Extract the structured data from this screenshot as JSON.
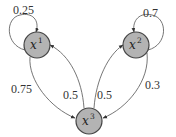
{
  "diagram": {
    "type": "markov-chain",
    "nodes": [
      {
        "id": "x1",
        "base": "x",
        "sup": "1",
        "cx": 37,
        "cy": 45
      },
      {
        "id": "x2",
        "base": "x",
        "sup": "2",
        "cx": 136,
        "cy": 45
      },
      {
        "id": "x3",
        "base": "x",
        "sup": "3",
        "cx": 89,
        "cy": 121
      }
    ],
    "edges": [
      {
        "from": "x1",
        "to": "x1",
        "label": "0.25"
      },
      {
        "from": "x2",
        "to": "x2",
        "label": "0.7"
      },
      {
        "from": "x1",
        "to": "x3",
        "label": "0.75"
      },
      {
        "from": "x3",
        "to": "x1",
        "label": "0.5"
      },
      {
        "from": "x3",
        "to": "x2",
        "label": "0.5"
      },
      {
        "from": "x2",
        "to": "x3",
        "label": "0.3"
      }
    ],
    "colors": {
      "node_fill": "#b3b3b3",
      "node_stroke": "#444444",
      "edge": "#666666"
    }
  }
}
